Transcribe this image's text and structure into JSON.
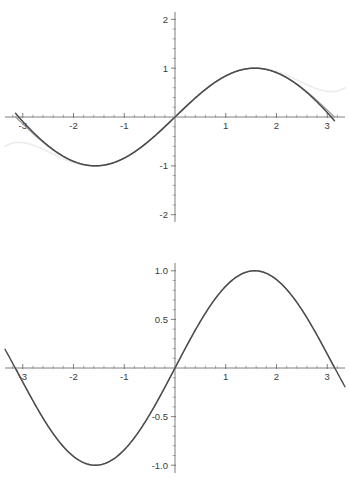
{
  "figure": {
    "background_color": "#ffffff",
    "width": 349,
    "height": 489,
    "panel_count": 2
  },
  "colors": {
    "sine_curve": "#9a9a9a",
    "approximation_curve": "#4a4a4a",
    "divergent_curve": "#ececec",
    "axis": "#6f6f6f",
    "tick_minor": "#8d8d8d",
    "label_text": "#3a3a3a"
  },
  "chart_data": [
    {
      "id": "top-panel",
      "type": "line",
      "title": "",
      "subtitle": "",
      "xlabel": "",
      "ylabel": "",
      "xlim": [
        -3.35,
        3.35
      ],
      "ylim": [
        -2.15,
        2.15
      ],
      "grid": false,
      "legend": "none",
      "x_ticks_major": [
        -3,
        -2,
        -1,
        1,
        2,
        3
      ],
      "x_tick_labels": [
        "-3",
        "-2",
        "-1",
        "1",
        "2",
        "3"
      ],
      "y_ticks_major": [
        -2,
        -1,
        1,
        2
      ],
      "y_tick_labels": [
        "-2",
        "-1",
        "1",
        "2"
      ],
      "x_minor_step": 0.2,
      "y_minor_step": 0.2,
      "axes_position": "zero-crossing",
      "series": [
        {
          "name": "sin(x)",
          "color": "#9a9a9a",
          "stroke_width": 1.3,
          "domain": [
            -3.14159,
            3.14159
          ],
          "function": "sin(x)",
          "x": [
            -3.1416,
            -2.9,
            -2.6,
            -2.3,
            -2.0,
            -1.7,
            -1.5708,
            -1.4,
            -1.1,
            -0.8,
            -0.5,
            -0.2,
            0.0,
            0.2,
            0.5,
            0.8,
            1.1,
            1.4,
            1.5708,
            1.7,
            2.0,
            2.3,
            2.6,
            2.9,
            3.1416
          ],
          "y": [
            0.0,
            -0.2392,
            -0.5155,
            -0.7457,
            -0.9093,
            -0.9917,
            -1.0,
            -0.9854,
            -0.8912,
            -0.7174,
            -0.4794,
            -0.1987,
            0.0,
            0.1987,
            0.4794,
            0.7174,
            0.8912,
            0.9854,
            1.0,
            0.9917,
            0.9093,
            0.7457,
            0.5155,
            0.2392,
            0.0
          ]
        },
        {
          "name": "Taylor approximation (close fit)",
          "color": "#4a4a4a",
          "stroke_width": 1.5,
          "domain": [
            -3.14159,
            3.14159
          ],
          "function": "x - x^3/6 + x^5/120 - x^7/5040",
          "x": [
            -3.1416,
            -2.9,
            -2.6,
            -2.3,
            -2.0,
            -1.7,
            -1.5708,
            -1.4,
            -1.1,
            -0.8,
            -0.5,
            -0.2,
            0.0,
            0.2,
            0.5,
            0.8,
            1.1,
            1.4,
            1.5708,
            1.7,
            2.0,
            2.3,
            2.6,
            2.9,
            3.1416
          ],
          "y": [
            -0.0752,
            -0.2765,
            -0.5338,
            -0.7547,
            -0.9129,
            -0.9925,
            -1.0001,
            -0.9855,
            -0.8912,
            -0.7174,
            -0.4794,
            -0.1987,
            0.0,
            0.1987,
            0.4794,
            0.7174,
            0.8912,
            0.9855,
            1.0001,
            0.9925,
            0.9129,
            0.7547,
            0.5338,
            0.2765,
            0.0752
          ]
        },
        {
          "name": "Lower-order Taylor approximation (divergent)",
          "color": "#ececec",
          "stroke_width": 1.6,
          "domain": [
            -3.35,
            3.35
          ],
          "function": "x - x^3/6 + x^5/120",
          "x": [
            -3.35,
            -3.2,
            -3.0,
            -2.8,
            -2.6,
            -2.4,
            -2.2,
            -2.0,
            -1.7,
            -1.4,
            -1.1,
            -0.8,
            -0.5,
            -0.2,
            0.0,
            0.2,
            0.5,
            0.8,
            1.1,
            1.4,
            1.7,
            2.0,
            2.2,
            2.4,
            2.6,
            2.8,
            3.0,
            3.2,
            3.35
          ],
          "y": [
            2.35,
            1.81,
            1.25,
            0.82,
            0.5,
            0.27,
            0.11,
            0.01,
            -0.07,
            -0.05,
            0.0,
            0.0,
            0.0,
            0.0,
            0.0,
            0.0,
            0.0,
            0.0,
            0.0,
            0.05,
            0.07,
            -0.01,
            -0.11,
            -0.27,
            -0.5,
            -0.82,
            -1.25,
            -1.81,
            -2.35
          ]
        }
      ]
    },
    {
      "id": "bottom-panel",
      "type": "line",
      "title": "",
      "subtitle": "",
      "xlabel": "",
      "ylabel": "",
      "xlim": [
        -3.35,
        3.35
      ],
      "ylim": [
        -1.08,
        1.08
      ],
      "grid": false,
      "legend": "none",
      "x_ticks_major": [
        -3,
        -2,
        -1,
        1,
        2,
        3
      ],
      "x_tick_labels": [
        "-3",
        "-2",
        "-1",
        "1",
        "2",
        "3"
      ],
      "y_ticks_major": [
        -1.0,
        -0.5,
        0.5,
        1.0
      ],
      "y_tick_labels": [
        "-1.0",
        "-0.5",
        "0.5",
        "1.0"
      ],
      "x_minor_step": 0.2,
      "y_minor_step": 0.1,
      "axes_position": "zero-crossing",
      "series": [
        {
          "name": "sin(x)",
          "color": "#9a9a9a",
          "stroke_width": 1.4,
          "domain": [
            -3.14159,
            3.14159
          ],
          "function": "sin(x)",
          "x": [
            -3.1416,
            -2.9,
            -2.6,
            -2.3,
            -2.0,
            -1.7,
            -1.5708,
            -1.4,
            -1.1,
            -0.8,
            -0.5,
            -0.2,
            0.0,
            0.2,
            0.5,
            0.8,
            1.1,
            1.4,
            1.5708,
            1.7,
            2.0,
            2.3,
            2.6,
            2.9,
            3.1416
          ],
          "y": [
            0.0,
            -0.2392,
            -0.5155,
            -0.7457,
            -0.9093,
            -0.9917,
            -1.0,
            -0.9854,
            -0.8912,
            -0.7174,
            -0.4794,
            -0.1987,
            0.0,
            0.1987,
            0.4794,
            0.7174,
            0.8912,
            0.9854,
            1.0,
            0.9917,
            0.9093,
            0.7457,
            0.5155,
            0.2392,
            0.0
          ]
        },
        {
          "name": "Higher-order Taylor approximation",
          "color": "#4a4a4a",
          "stroke_width": 1.4,
          "domain": [
            -3.35,
            3.35
          ],
          "function": "x - x^3/6 + x^5/120 - x^7/5040 + x^9/362880",
          "x": [
            -3.35,
            -3.25,
            -3.1416,
            -3.0,
            -2.7,
            -2.4,
            -2.1,
            -1.8,
            -1.5708,
            -1.3,
            -1.0,
            -0.7,
            -0.4,
            -0.1,
            0.0,
            0.1,
            0.4,
            0.7,
            1.0,
            1.3,
            1.5708,
            1.8,
            2.1,
            2.4,
            2.7,
            3.0,
            3.1416,
            3.25,
            3.35
          ],
          "y": [
            -0.42,
            -0.23,
            0.0,
            0.1411,
            0.4274,
            0.6755,
            0.8632,
            0.9738,
            1.0,
            0.9636,
            0.8415,
            0.6442,
            0.3894,
            0.0998,
            0.0,
            -0.0998,
            -0.3894,
            -0.6442,
            -0.8415,
            -0.9636,
            -1.0,
            -0.9738,
            -0.8632,
            -0.6755,
            -0.4274,
            -0.1411,
            0.0,
            0.23,
            0.42
          ]
        }
      ]
    }
  ]
}
